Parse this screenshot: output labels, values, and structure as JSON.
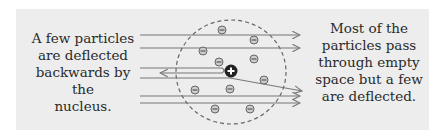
{
  "diagram": {
    "left_label": [
      "A few particles",
      "are deflected",
      "backwards by the",
      "nucleus."
    ],
    "right_label": [
      "Most of the",
      "particles pass",
      "through empty",
      "space but a few",
      "are deflected."
    ],
    "nucleus_symbol": "+",
    "electron_symbol": "−",
    "colors": {
      "background": "#ededed",
      "lines": "#777777",
      "text": "#2a2a2a",
      "nucleus": "#222222",
      "electron": "#999999"
    }
  }
}
